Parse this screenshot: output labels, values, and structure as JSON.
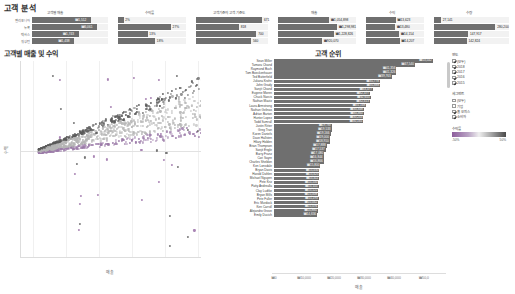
{
  "page": {
    "title": "고객 분석"
  },
  "kpi_panels": [
    {
      "name": "customer-count",
      "title": "고객별 매출",
      "rows": [
        {
          "label": "캘리포니아",
          "value": "₩1,512",
          "pct": 78,
          "inside": true
        },
        {
          "label": "뉴욕",
          "value": "₩6,061",
          "pct": 86,
          "inside": true
        },
        {
          "label": "텍사스",
          "value": "₩1,743",
          "pct": 62,
          "inside": true
        },
        {
          "label": "워싱턴",
          "value": "₩1,438",
          "pct": 56,
          "inside": true
        }
      ]
    },
    {
      "name": "profit-ratio",
      "title": "수익률",
      "rows": [
        {
          "label": "",
          "value": "2%",
          "pct": 9,
          "inside": false
        },
        {
          "label": "",
          "value": "27%",
          "pct": 78,
          "inside": false
        },
        {
          "label": "",
          "value": "13%",
          "pct": 44,
          "inside": false
        },
        {
          "label": "",
          "value": "18%",
          "pct": 55,
          "inside": false
        }
      ]
    },
    {
      "name": "customer-count-panel",
      "title": "고객 기준의 고객 기준도",
      "rows": [
        {
          "label": "",
          "value": "671",
          "pct": 92,
          "inside": false
        },
        {
          "label": "",
          "value": "818",
          "pct": 60,
          "inside": false
        },
        {
          "label": "",
          "value": "700",
          "pct": 84,
          "inside": false
        },
        {
          "label": "",
          "value": "560",
          "pct": 77,
          "inside": false
        }
      ]
    },
    {
      "name": "sales-panel",
      "title": "매출",
      "rows": [
        {
          "label": "",
          "value": "₩1,054,898",
          "pct": 66,
          "inside": false
        },
        {
          "label": "",
          "value": "₩1,298,981",
          "pct": 76,
          "inside": false
        },
        {
          "label": "",
          "value": "₩1,228,826",
          "pct": 72,
          "inside": false
        },
        {
          "label": "",
          "value": "₩920,070",
          "pct": 57,
          "inside": false
        }
      ]
    },
    {
      "name": "profit-panel",
      "title": "수익",
      "rows": [
        {
          "label": "",
          "value": "₩13,623",
          "pct": 52,
          "inside": false
        },
        {
          "label": "",
          "value": "₩13,480",
          "pct": 51,
          "inside": false
        },
        {
          "label": "",
          "value": "₩14,154",
          "pct": 58,
          "inside": false
        },
        {
          "label": "",
          "value": "₩14,207",
          "pct": 59,
          "inside": false
        }
      ]
    },
    {
      "name": "quantity-panel",
      "title": "수량",
      "rows": [
        {
          "label": "",
          "value": "27,141",
          "pct": 10,
          "inside": false
        },
        {
          "label": "",
          "value": "280,200",
          "pct": 82,
          "inside": false
        },
        {
          "label": "",
          "value": "147,917",
          "pct": 46,
          "inside": false
        },
        {
          "label": "",
          "value": "142,824",
          "pct": 44,
          "inside": false
        }
      ]
    }
  ],
  "scatter": {
    "title": "고객별 매출 및 수익",
    "xlabel": "매출",
    "ylabel": "수익",
    "yticks": [
      "₩1",
      "₩1",
      "₩1",
      "₩0",
      "-₩0",
      "-₩0",
      "-₩1",
      "-₩1"
    ],
    "xticks": [
      "₩0",
      "₩1,000",
      "₩2,000",
      "₩3,000",
      "₩4,000",
      "₩5,0"
    ]
  },
  "rank": {
    "title": "고객 순위",
    "xlabel": "매출",
    "xticks": [
      "₩0",
      "₩10,000",
      "₩20,000",
      "₩30,000",
      "₩40,000",
      "₩50,0"
    ],
    "xmax": 58000,
    "rows": [
      {
        "name": "Sean Miller",
        "value": "₩53,542",
        "v": 53542
      },
      {
        "name": "Tamara Chand",
        "value": "₩47,540",
        "v": 47540
      },
      {
        "name": "Raymond Buch",
        "value": "₩41,356",
        "v": 41356
      },
      {
        "name": "Tom Boeckenhauer",
        "value": "₩41,326",
        "v": 41326
      },
      {
        "name": "Ted Butterfield",
        "value": "₩39,763",
        "v": 39763
      },
      {
        "name": "Juliana Krohn",
        "value": "₩35,778",
        "v": 35778
      },
      {
        "name": "John Grady",
        "value": "₩35,888",
        "v": 35888
      },
      {
        "name": "Sanjit Chand",
        "value": "₩33,477",
        "v": 33477
      },
      {
        "name": "Eugene Moren",
        "value": "₩32,477",
        "v": 32477
      },
      {
        "name": "Chuck Narcis",
        "value": "₩32,655",
        "v": 32655
      },
      {
        "name": "Nathan Mautz",
        "value": "₩32,413",
        "v": 32413
      },
      {
        "name": "Laura Armstrong",
        "value": "₩31,168",
        "v": 31168
      },
      {
        "name": "Nathan Gelinas",
        "value": "₩30,348",
        "v": 30348
      },
      {
        "name": "Adrian Barton",
        "value": "₩30,360",
        "v": 30360
      },
      {
        "name": "Hunter Lopez",
        "value": "₩30,243",
        "v": 30243
      },
      {
        "name": "Todd Sumrall",
        "value": "₩30,165",
        "v": 30165
      },
      {
        "name": "Justin Ritter",
        "value": "₩19,787",
        "v": 19787
      },
      {
        "name": "Greg Tran",
        "value": "₩19,533",
        "v": 19533
      },
      {
        "name": "Karen Daniels",
        "value": "₩19,166",
        "v": 19166
      },
      {
        "name": "Dave Hallsten",
        "value": "₩19,000",
        "v": 19000
      },
      {
        "name": "Hilary Holden",
        "value": "₩18,910",
        "v": 18910
      },
      {
        "name": "Brian Thompson",
        "value": "₩17,888",
        "v": 17888
      },
      {
        "name": "Sanjit Engle",
        "value": "₩17,537",
        "v": 17537
      },
      {
        "name": "Barry Franz",
        "value": "₩17,080",
        "v": 17080
      },
      {
        "name": "Cari Sayre",
        "value": "₩16,844",
        "v": 16844
      },
      {
        "name": "Charles Sheldon",
        "value": "₩16,866",
        "v": 16866
      },
      {
        "name": "Ken Lonsdale",
        "value": "₩15,800",
        "v": 15800
      },
      {
        "name": "Bryan Davis",
        "value": "₩15,430",
        "v": 15430
      },
      {
        "name": "Harold Dahlen",
        "value": "₩15,425",
        "v": 15425
      },
      {
        "name": "Michael Nguyen",
        "value": "₩15,411",
        "v": 15411
      },
      {
        "name": "Pete Kriz",
        "value": "₩15,100",
        "v": 15100
      },
      {
        "name": "Patty Andrealla",
        "value": "₩15,155",
        "v": 15155
      },
      {
        "name": "Clay Ludtke",
        "value": "₩15,122",
        "v": 15122
      },
      {
        "name": "Bryan Mills",
        "value": "₩15,008",
        "v": 15008
      },
      {
        "name": "Pete Fuller",
        "value": "₩15,193",
        "v": 15193
      },
      {
        "name": "Eric Murdock",
        "value": "₩15,042",
        "v": 15042
      },
      {
        "name": "Ken Carroll",
        "value": "₩15,076",
        "v": 15076
      },
      {
        "name": "Alejandro Grove",
        "value": "₩14,884",
        "v": 14884
      },
      {
        "name": "Emily Ducich",
        "value": "₩14,656",
        "v": 14656
      }
    ]
  },
  "filters": {
    "year": {
      "title": "연도",
      "items": [
        {
          "label": "(모두)",
          "checked": true
        },
        {
          "label": "2018",
          "checked": true
        },
        {
          "label": "2017",
          "checked": true
        },
        {
          "label": "2016",
          "checked": true
        },
        {
          "label": "2015",
          "checked": true
        }
      ]
    },
    "segment": {
      "title": "세그먼트",
      "items": [
        {
          "label": "(모두)",
          "checked": false
        },
        {
          "label": "기업",
          "checked": false
        },
        {
          "label": "홈 오피스",
          "checked": true
        },
        {
          "label": "소비자",
          "checked": true
        }
      ]
    },
    "color_legend": {
      "title": "수익률",
      "min": "-50%",
      "max": "50%",
      "low_color": "#8d5d9c",
      "high_color": "#4a4a4a"
    }
  }
}
